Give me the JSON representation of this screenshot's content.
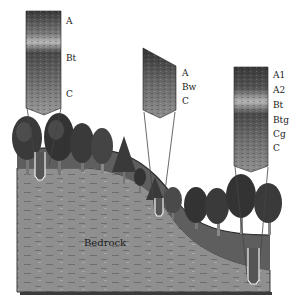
{
  "diagram": {
    "type": "soil-profile-landscape",
    "colors": {
      "background": "#ffffff",
      "topsoil": "#5e5e5e",
      "bedrock": "#8f8f8f",
      "bedrock_edge": "#3a3a3a",
      "tree_dark": "#2b2b2b",
      "tree_mid": "#6a6a6a",
      "profile_dark": "#3c3c3c",
      "profile_light": "#a9a9a9"
    },
    "profiles": [
      {
        "position": "upland-left",
        "horizons": [
          {
            "label": "A"
          },
          {
            "label": "Bt"
          },
          {
            "label": "C"
          }
        ]
      },
      {
        "position": "slope-middle",
        "horizons": [
          {
            "label": "A"
          },
          {
            "label": "Bw"
          },
          {
            "label": "C"
          }
        ]
      },
      {
        "position": "lowland-right",
        "horizons": [
          {
            "label": "A1"
          },
          {
            "label": "A2"
          },
          {
            "label": "Bt"
          },
          {
            "label": "Btg"
          },
          {
            "label": "Cg"
          },
          {
            "label": "C"
          }
        ]
      }
    ],
    "bedrock_label": "Bedrock"
  }
}
